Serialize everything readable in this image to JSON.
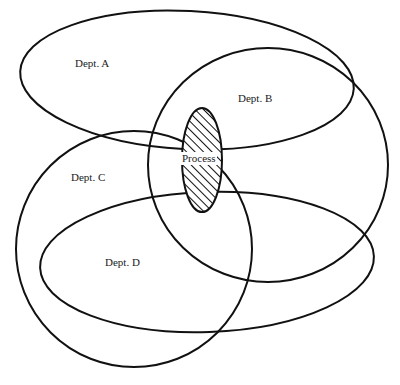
{
  "diagram": {
    "type": "venn-overlap",
    "stroke_color": "#111111",
    "background": "#ffffff",
    "sets": [
      {
        "id": "A",
        "label": "Dept. A"
      },
      {
        "id": "B",
        "label": "Dept. B"
      },
      {
        "id": "C",
        "label": "Dept. C"
      },
      {
        "id": "D",
        "label": "Dept. D"
      }
    ],
    "center": {
      "label": "Process",
      "fill": "diagonal-hatch"
    }
  }
}
